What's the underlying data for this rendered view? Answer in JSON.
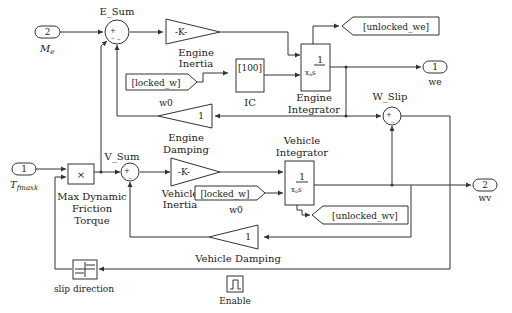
{
  "diagram": {
    "ports": {
      "in_me": {
        "number": "2",
        "label": "M",
        "sub": "e"
      },
      "in_tfmaxk": {
        "number": "1",
        "label": "T",
        "sub": "fmaxk"
      },
      "out_we": {
        "number": "1",
        "label": "we"
      },
      "out_wv": {
        "number": "2",
        "label": "wv"
      }
    },
    "sums": {
      "e_sum": {
        "label": "E_Sum",
        "signs": "+––"
      },
      "v_sum": {
        "label": "V_Sum",
        "signs": "+–"
      },
      "w_slip": {
        "label": "W_Slip",
        "signs": "+–"
      }
    },
    "gains": {
      "engine_inertia": {
        "value": "-K-",
        "label_line1": "Engine",
        "label_line2": "Inertia"
      },
      "engine_damping": {
        "value": "1",
        "label": "w0"
      },
      "vehicle_inertia": {
        "value": "-K-",
        "label_top1": "Engine",
        "label_top2": "Damping",
        "label_line1": "Vehicle",
        "label_line2": "Inertia"
      },
      "vehicle_damping": {
        "value": "1",
        "label": "Vehicle Damping"
      }
    },
    "integrators": {
      "engine": {
        "num": "1",
        "den": "x",
        "den_sub": "o",
        "den_s": "s",
        "label_line1": "Engine",
        "label_line2": "Integrator"
      },
      "vehicle": {
        "num": "1",
        "den": "x",
        "den_sub": "o",
        "den_s": "s",
        "label_line1": "Vehicle",
        "label_line2": "Integrator"
      }
    },
    "ic": {
      "value": "[100]",
      "label": "IC"
    },
    "from_tags": {
      "locked_w_1": {
        "text": "[locked_w]",
        "label": "w0"
      },
      "locked_w_2": {
        "text": "[locked_w]",
        "label": "w0"
      }
    },
    "goto_tags": {
      "unlocked_we": {
        "text": "[unlocked_we]"
      },
      "unlocked_wv": {
        "text": "[unlocked_wv]"
      }
    },
    "product": {
      "symbol": "×",
      "label_line1": "Max Dynamic",
      "label_line2": "Friction",
      "label_line3": "Torque"
    },
    "sign": {
      "label": "slip direction"
    },
    "enable": {
      "symbol": "⎍",
      "label": "Enable"
    }
  }
}
